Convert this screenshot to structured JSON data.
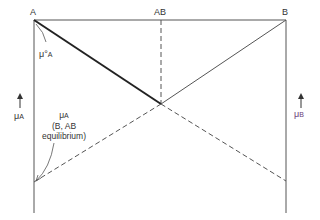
{
  "diagram": {
    "type": "chemical-potential diagram",
    "corners": {
      "left": "A",
      "middle": "AB",
      "right": "B"
    },
    "labels": {
      "mu_standard_A": {
        "symbol": "μ°",
        "sub": "A"
      },
      "mu_A_axis": {
        "symbol": "μ",
        "sub": "A"
      },
      "mu_B_axis": {
        "symbol": "μ",
        "sub": "B"
      },
      "mu_A_equilibrium": {
        "symbol": "μ",
        "sub": "A",
        "line2": "(B, AB",
        "line3": "equilibrium)"
      }
    },
    "colors": {
      "line": "#555555",
      "bold_line": "#222222",
      "text": "#333333",
      "mu_B_text": "#6a3d7a"
    }
  }
}
